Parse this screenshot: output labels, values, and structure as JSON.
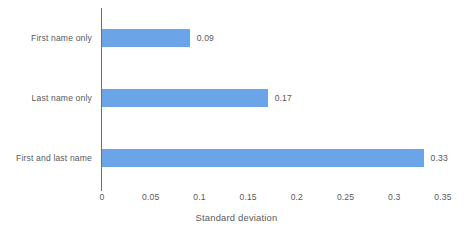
{
  "chart_data": {
    "type": "bar",
    "orientation": "horizontal",
    "title": "",
    "xlabel": "Standard deviation",
    "ylabel": "",
    "categories": [
      "First name only",
      "Last name only",
      "First and last name"
    ],
    "values": [
      0.09,
      0.17,
      0.33
    ],
    "value_labels": [
      "0.09",
      "0.17",
      "0.33"
    ],
    "xlim": [
      0,
      0.35
    ],
    "xticks": [
      0,
      0.05,
      0.1,
      0.15,
      0.2,
      0.25,
      0.3,
      0.35
    ],
    "xtick_labels": [
      "0",
      "0.05",
      "0.1",
      "0.15",
      "0.2",
      "0.25",
      "0.3",
      "0.35"
    ],
    "grid": false,
    "legend": null,
    "series": [
      {
        "name": "Standard deviation",
        "values": [
          0.09,
          0.17,
          0.33
        ]
      }
    ],
    "colors": {
      "bar": "#6ba5e7",
      "text": "#58595b",
      "axis": "#6d6e70",
      "background": "#ffffff"
    }
  }
}
